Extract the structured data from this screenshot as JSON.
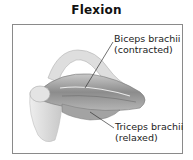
{
  "title": "Flexion",
  "labels": [
    {
      "line1": "Biceps brachii",
      "line2": "(contracted)"
    },
    {
      "line1": "Triceps brachii",
      "line2": "(relaxed)"
    }
  ],
  "illustration": "flexed-arm-muscle-anatomy",
  "colors": {
    "frame": "#8a8a8a",
    "muscle": "#9a9a9a",
    "bone": "#d8d8d8",
    "text": "#222222"
  }
}
